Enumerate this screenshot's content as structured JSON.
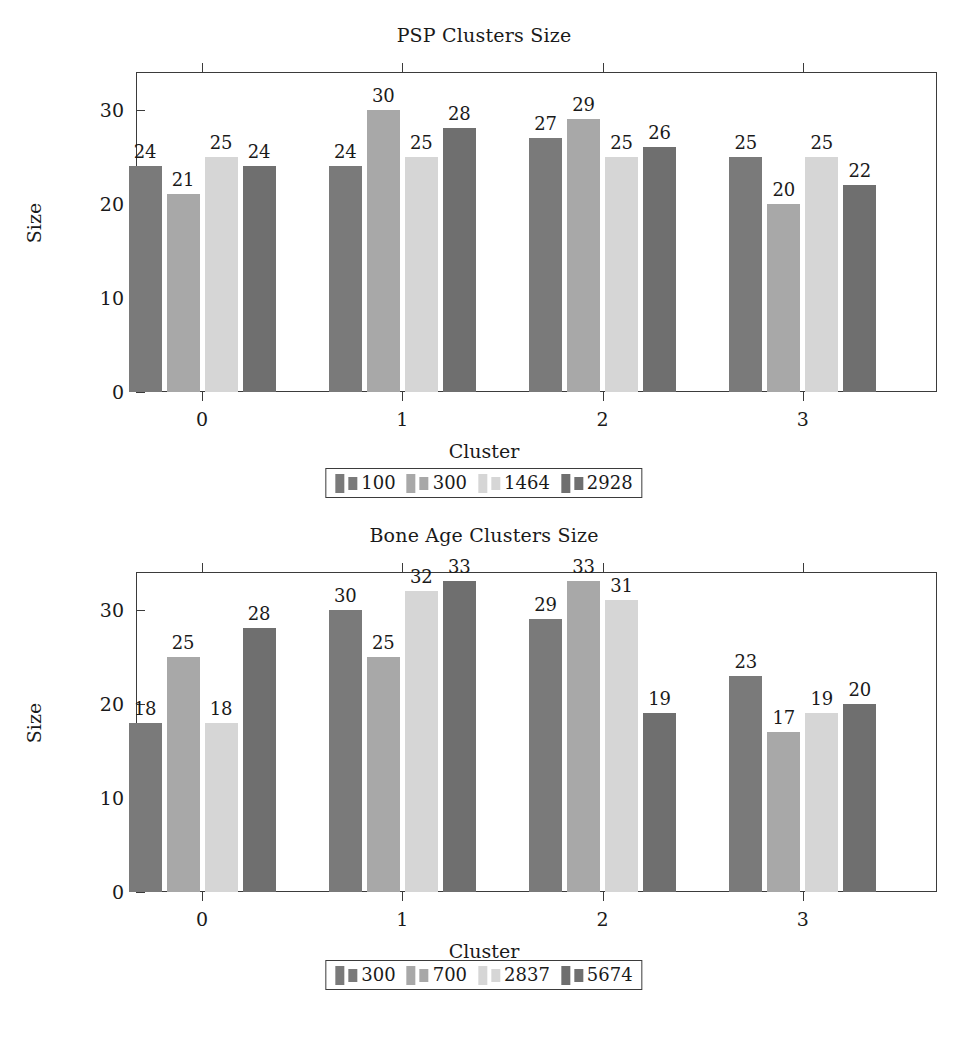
{
  "figure": {
    "background": "#ffffff",
    "axis_color": "#3b3b3b",
    "text_color": "#1a1a1a"
  },
  "series_colors": [
    "#7a7a7a",
    "#a8a8a8",
    "#d6d6d6",
    "#6f6f6f"
  ],
  "chart_data": [
    {
      "type": "bar",
      "title": "PSP Clusters Size",
      "xlabel": "Cluster",
      "ylabel": "Size",
      "categories": [
        "0",
        "1",
        "2",
        "3"
      ],
      "yticks": [
        "0",
        "10",
        "20",
        "30"
      ],
      "ylim": [
        0,
        34
      ],
      "grid": false,
      "legend_position": "below",
      "series": [
        {
          "name": "100",
          "values": [
            24,
            24,
            27,
            25
          ]
        },
        {
          "name": "300",
          "values": [
            21,
            30,
            29,
            20
          ]
        },
        {
          "name": "1464",
          "values": [
            25,
            25,
            25,
            25
          ]
        },
        {
          "name": "2928",
          "values": [
            24,
            28,
            26,
            22
          ]
        }
      ]
    },
    {
      "type": "bar",
      "title": "Bone Age Clusters Size",
      "xlabel": "Cluster",
      "ylabel": "Size",
      "categories": [
        "0",
        "1",
        "2",
        "3"
      ],
      "yticks": [
        "0",
        "10",
        "20",
        "30"
      ],
      "ylim": [
        0,
        34
      ],
      "grid": false,
      "legend_position": "below",
      "series": [
        {
          "name": "300",
          "values": [
            18,
            30,
            29,
            23
          ]
        },
        {
          "name": "700",
          "values": [
            25,
            25,
            33,
            17
          ]
        },
        {
          "name": "2837",
          "values": [
            18,
            32,
            31,
            19
          ]
        },
        {
          "name": "5674",
          "values": [
            28,
            33,
            19,
            20
          ]
        }
      ]
    }
  ]
}
